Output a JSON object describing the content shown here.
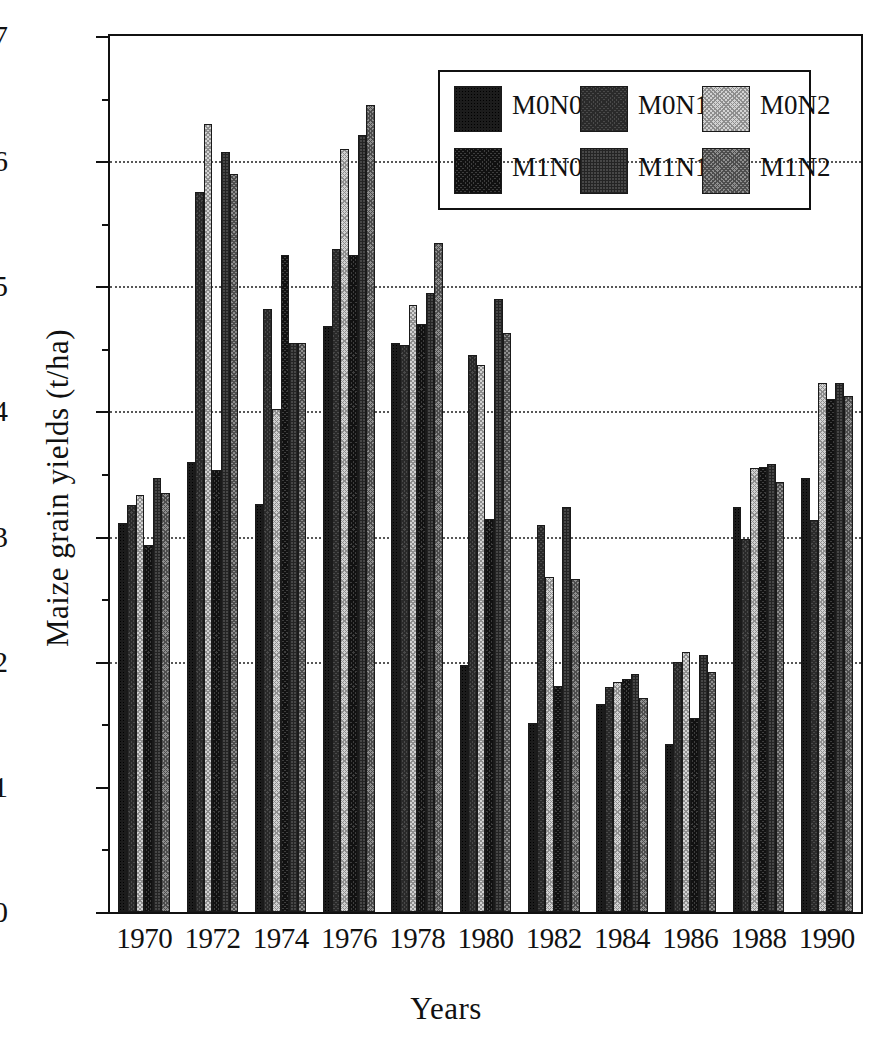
{
  "chart_data": {
    "type": "bar",
    "title": "",
    "xlabel": "Years",
    "ylabel": "Maize grain yields (t/ha)",
    "ylim": [
      0,
      7
    ],
    "ytick_labels": [
      "0",
      "1",
      "2",
      "3",
      "4",
      "5",
      "6",
      "7"
    ],
    "ytick_values": [
      0,
      1,
      2,
      3,
      4,
      5,
      6,
      7
    ],
    "yminor_values": [
      0.5,
      1.5,
      2.5,
      3.5,
      4.5,
      5.5,
      6.5
    ],
    "gridlines_at": [
      2,
      3,
      4,
      5,
      6
    ],
    "grid": true,
    "legend_position": "top-right",
    "categories": [
      "1970",
      "1972",
      "1974",
      "1976",
      "1978",
      "1980",
      "1982",
      "1984",
      "1986",
      "1988",
      "1990"
    ],
    "series": [
      {
        "name": "M0N0",
        "color": "#1c1c1c",
        "values": [
          3.11,
          3.6,
          3.26,
          4.68,
          4.55,
          1.97,
          1.51,
          1.66,
          1.34,
          3.24,
          3.47
        ]
      },
      {
        "name": "M0N1",
        "color": "#4a4a4a",
        "values": [
          3.25,
          5.75,
          4.82,
          5.3,
          4.53,
          4.45,
          3.09,
          1.8,
          2.0,
          2.98,
          3.13
        ]
      },
      {
        "name": "M0N2",
        "color": "#d3d3d3",
        "values": [
          3.33,
          6.3,
          4.02,
          6.1,
          4.85,
          4.37,
          2.68,
          1.84,
          2.08,
          3.55,
          4.23
        ]
      },
      {
        "name": "M1N0",
        "color": "#3e3e3e",
        "values": [
          2.93,
          3.53,
          5.25,
          5.25,
          4.7,
          3.14,
          1.81,
          1.86,
          1.55,
          3.56,
          4.1
        ]
      },
      {
        "name": "M1N1",
        "color": "#474747",
        "values": [
          3.47,
          6.07,
          4.55,
          6.21,
          4.95,
          4.9,
          3.24,
          1.9,
          2.05,
          3.58,
          4.23
        ]
      },
      {
        "name": "M1N2",
        "color": "#8f8f8f",
        "values": [
          3.35,
          5.9,
          4.55,
          6.45,
          5.35,
          4.63,
          2.66,
          1.71,
          1.92,
          3.44,
          4.12
        ]
      }
    ]
  },
  "legend": {
    "rows": [
      [
        "M0N0",
        "M0N1",
        "M0N2"
      ],
      [
        "M1N0",
        "M1N1",
        "M1N2"
      ]
    ]
  }
}
